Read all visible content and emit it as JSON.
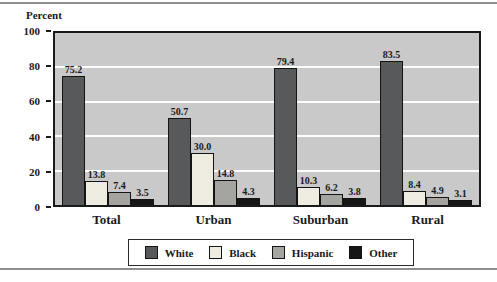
{
  "figure": {
    "ylabel": "Percent"
  },
  "chart_data": {
    "type": "bar",
    "title": "",
    "xlabel": "",
    "ylabel": "Percent",
    "ylim": [
      0,
      100
    ],
    "yticks": [
      0,
      20,
      40,
      60,
      80,
      100
    ],
    "gridlines": [
      20,
      40,
      60,
      80
    ],
    "gridline_color": "#ffffff",
    "plot_background": "#c9c9c9",
    "legend_position": "bottom",
    "value_label_decimals": 1,
    "categories": [
      "Total",
      "Urban",
      "Suburban",
      "Rural"
    ],
    "series": [
      {
        "name": "White",
        "color": "#58595b",
        "values": [
          75.2,
          50.7,
          79.4,
          83.5
        ]
      },
      {
        "name": "Black",
        "color": "#efece1",
        "values": [
          13.8,
          30.0,
          10.3,
          8.4
        ]
      },
      {
        "name": "Hispanic",
        "color": "#a5a4a0",
        "values": [
          7.4,
          14.8,
          6.2,
          4.9
        ]
      },
      {
        "name": "Other",
        "color": "#161616",
        "values": [
          3.5,
          4.3,
          3.8,
          3.1
        ]
      }
    ]
  },
  "legend": {
    "items": [
      "White",
      "Black",
      "Hispanic",
      "Other"
    ]
  }
}
